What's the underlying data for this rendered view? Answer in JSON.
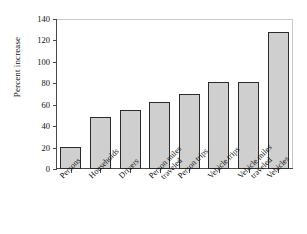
{
  "chart_data": {
    "type": "bar",
    "title": "",
    "subtitle": "",
    "xlabel": "",
    "ylabel": "Percent increase",
    "ylim": [
      0,
      140
    ],
    "ytick_labels": [
      "140",
      "120",
      "100",
      "80",
      "60",
      "40",
      "20",
      "0"
    ],
    "ytick_values": [
      140,
      120,
      100,
      80,
      60,
      40,
      20,
      0
    ],
    "grid": false,
    "legend": null,
    "categories": [
      "Persons",
      "Households",
      "Drivers",
      "Person miles traveled",
      "Person trips",
      "Vehicle trips",
      "Vehicle miles traveled",
      "Vehicles"
    ],
    "category_lines": [
      [
        "Persons"
      ],
      [
        "Households"
      ],
      [
        "Drivers"
      ],
      [
        "Person miles",
        "traveled"
      ],
      [
        "Person trips"
      ],
      [
        "Vehicle trips"
      ],
      [
        "Vehicle miles",
        "traveled"
      ],
      [
        "Vehicles"
      ]
    ],
    "values": [
      21,
      49,
      55,
      63,
      70,
      81,
      81,
      128
    ],
    "bar_fill_color": "#cfcfcf",
    "bar_edge_color": "#2b2b2b",
    "axis_color": "#4a4a4a",
    "background_color": "#ffffff"
  }
}
